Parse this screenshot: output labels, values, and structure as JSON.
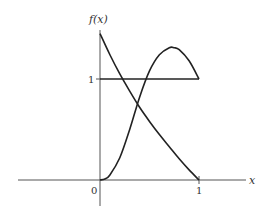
{
  "chart_data": {
    "type": "line",
    "title": "",
    "xlabel": "x",
    "ylabel": "f(x)",
    "xlim": [
      -0.83,
      1.5
    ],
    "ylim": [
      -0.25,
      1.6
    ],
    "x_ticks": [
      {
        "value": 0,
        "label": "0"
      },
      {
        "value": 1,
        "label": "1"
      }
    ],
    "y_ticks": [
      {
        "value": 1,
        "label": "1"
      }
    ],
    "grid": false,
    "legend": null,
    "series": [
      {
        "name": "uniform density",
        "x": [
          0,
          1
        ],
        "y": [
          1,
          1
        ]
      },
      {
        "name": "decreasing density",
        "x": [
          0,
          0.1,
          0.2,
          0.3,
          0.4,
          0.5,
          0.6,
          0.7,
          0.8,
          0.9,
          1.0
        ],
        "y": [
          1.45,
          1.24,
          1.05,
          0.88,
          0.72,
          0.58,
          0.45,
          0.33,
          0.21,
          0.1,
          0
        ]
      },
      {
        "name": "increasing-then-decreasing density",
        "x": [
          0,
          0.05,
          0.1,
          0.2,
          0.3,
          0.4,
          0.5,
          0.6,
          0.7,
          0.75,
          0.8,
          0.9,
          1.0
        ],
        "y": [
          0,
          0.01,
          0.05,
          0.22,
          0.5,
          0.82,
          1.08,
          1.24,
          1.31,
          1.31,
          1.29,
          1.18,
          1.0
        ]
      }
    ]
  },
  "labels": {
    "y_axis": "f(x)",
    "x_axis": "x",
    "origin": "0",
    "x_one": "1",
    "y_one": "1"
  }
}
